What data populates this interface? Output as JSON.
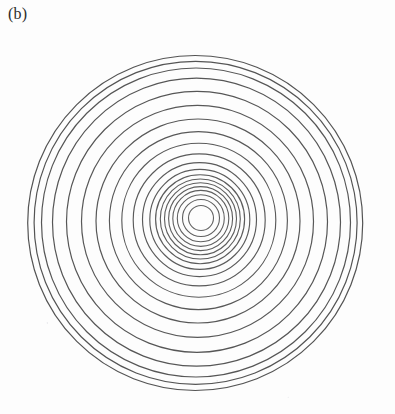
{
  "figure": {
    "panel_label": "(b)",
    "caption_visible": false,
    "background_color": "#fdfdfd",
    "ink_color": "#5e5e5e",
    "width_px": 395,
    "height_px": 414
  },
  "chart_data": {
    "type": "scatter",
    "plot_style": "concentric-ring-interference-pattern",
    "title": "(b)",
    "subtitle": "",
    "xlabel": "",
    "ylabel": "",
    "xlim": [
      0,
      395
    ],
    "ylim": [
      0,
      414
    ],
    "grid": false,
    "legend": null,
    "axes_visible": false,
    "tick_labels_x": [],
    "tick_labels_y": [],
    "annotations": [
      {
        "text": "(b)",
        "x": 8,
        "y": 14
      }
    ],
    "center": {
      "x": 201,
      "y": 218
    },
    "ring_count": 20,
    "stroke_color": "#5e5e5e",
    "stroke_width": 1.15,
    "rings": [
      {
        "n": 1,
        "radius": 12.5,
        "cx": 201.0,
        "cy": 218.0,
        "rx": 12.5,
        "ry": 12.5,
        "stroke": "#636363",
        "width": 1.1
      },
      {
        "n": 2,
        "radius": 18.5,
        "cx": 201.0,
        "cy": 218.0,
        "rx": 18.5,
        "ry": 18.5,
        "stroke": "#606060",
        "width": 1.1
      },
      {
        "n": 3,
        "radius": 23.5,
        "cx": 200.8,
        "cy": 218.2,
        "rx": 23.5,
        "ry": 23.5,
        "stroke": "#606060",
        "width": 1.1
      },
      {
        "n": 4,
        "radius": 28.0,
        "cx": 200.8,
        "cy": 218.4,
        "rx": 28.0,
        "ry": 28.0,
        "stroke": "#5e5e5e",
        "width": 1.1
      },
      {
        "n": 5,
        "radius": 32.0,
        "cx": 200.6,
        "cy": 218.6,
        "rx": 32.0,
        "ry": 32.0,
        "stroke": "#5e5e5e",
        "width": 1.1
      },
      {
        "n": 6,
        "radius": 36.0,
        "cx": 200.5,
        "cy": 218.8,
        "rx": 36.0,
        "ry": 36.0,
        "stroke": "#5e5e5e",
        "width": 1.1
      },
      {
        "n": 7,
        "radius": 40.0,
        "cx": 200.3,
        "cy": 219.0,
        "rx": 40.0,
        "ry": 40.0,
        "stroke": "#5c5c5c",
        "width": 1.1
      },
      {
        "n": 8,
        "radius": 44.5,
        "cx": 200.1,
        "cy": 219.2,
        "rx": 44.5,
        "ry": 44.5,
        "stroke": "#5c5c5c",
        "width": 1.15
      },
      {
        "n": 9,
        "radius": 50.0,
        "cx": 199.8,
        "cy": 219.4,
        "rx": 50.0,
        "ry": 50.0,
        "stroke": "#5c5c5c",
        "width": 1.15
      },
      {
        "n": 10,
        "radius": 57.0,
        "cx": 199.5,
        "cy": 219.6,
        "rx": 57.0,
        "ry": 57.0,
        "stroke": "#5a5a5a",
        "width": 1.15
      },
      {
        "n": 11,
        "radius": 66.0,
        "cx": 199.2,
        "cy": 219.9,
        "rx": 66.0,
        "ry": 66.0,
        "stroke": "#5a5a5a",
        "width": 1.15
      },
      {
        "n": 12,
        "radius": 77.0,
        "cx": 198.8,
        "cy": 220.2,
        "rx": 77.0,
        "ry": 77.0,
        "stroke": "#5a5a5a",
        "width": 1.15
      },
      {
        "n": 13,
        "radius": 89.0,
        "cx": 198.4,
        "cy": 220.6,
        "rx": 89.0,
        "ry": 89.0,
        "stroke": "#585858",
        "width": 1.15
      },
      {
        "n": 14,
        "radius": 102.0,
        "cx": 198.0,
        "cy": 221.0,
        "rx": 102.0,
        "ry": 102.0,
        "stroke": "#585858",
        "width": 1.2
      },
      {
        "n": 15,
        "radius": 116.0,
        "cx": 197.5,
        "cy": 221.4,
        "rx": 116.0,
        "ry": 116.0,
        "stroke": "#585858",
        "width": 1.2
      },
      {
        "n": 16,
        "radius": 130.5,
        "cx": 197.0,
        "cy": 221.8,
        "rx": 130.5,
        "ry": 130.5,
        "stroke": "#565656",
        "width": 1.2
      },
      {
        "n": 17,
        "radius": 144.0,
        "cx": 196.5,
        "cy": 222.2,
        "rx": 144.0,
        "ry": 144.0,
        "stroke": "#565656",
        "width": 1.2
      },
      {
        "n": 18,
        "radius": 154.5,
        "cx": 196.0,
        "cy": 222.5,
        "rx": 154.5,
        "ry": 154.5,
        "stroke": "#565656",
        "width": 1.2
      },
      {
        "n": 19,
        "radius": 161.5,
        "cx": 195.6,
        "cy": 222.8,
        "rx": 161.5,
        "ry": 161.5,
        "stroke": "#545454",
        "width": 1.2
      },
      {
        "n": 20,
        "radius": 167.5,
        "cx": 195.2,
        "cy": 223.0,
        "rx": 167.5,
        "ry": 167.5,
        "stroke": "#545454",
        "width": 1.2
      }
    ]
  }
}
